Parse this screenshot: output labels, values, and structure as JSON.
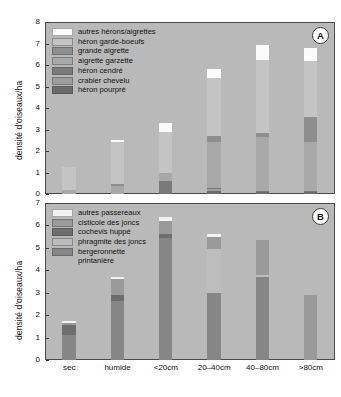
{
  "figure": {
    "panels": [
      {
        "tag": "A",
        "ylabel": "densité d'oiseaux/ha",
        "yticks": [
          "0",
          "1",
          "2",
          "3",
          "4",
          "5",
          "6",
          "7",
          "8"
        ],
        "ylim": [
          0,
          8
        ]
      },
      {
        "tag": "B",
        "ylabel": "densité d'oiseaux/ha",
        "yticks": [
          "0",
          "1",
          "2",
          "3",
          "4",
          "5",
          "6",
          "7"
        ],
        "ylim": [
          0,
          7
        ]
      }
    ],
    "xlabels": [
      "sec",
      "humide",
      "<20cm",
      "20–40cm",
      "40–80cm",
      ">80cm"
    ]
  },
  "colors": {
    "plot_background": "#b9b9b9",
    "axis": "#4a4a4a",
    "text": "#111111",
    "autres_herons": "#fbfbfb",
    "heron_garde_boeufs": "#c4c4c4",
    "grande_aigrette": "#8e8e8e",
    "aigrette_garzette": "#a8a8a8",
    "heron_cendre": "#7a7a7a",
    "crabier_chevelu": "#9d9d9d",
    "heron_pourpre": "#6b6b6b",
    "autres_passereaux": "#f2f2f2",
    "cisticole_des_joncs": "#9a9a9a",
    "cochevis_huppe": "#6e6e6e",
    "phragmite_des_joncs": "#bdbdbd",
    "bergeronnette_printaniere": "#868686"
  },
  "chart_data": [
    {
      "type": "bar",
      "id": "panel-a",
      "title": "",
      "panel_tag": "A",
      "stacked": true,
      "xlabel": "",
      "ylabel": "densité d'oiseaux/ha",
      "ylim": [
        0,
        8
      ],
      "yticks": [
        0,
        1,
        2,
        3,
        4,
        5,
        6,
        7,
        8
      ],
      "grid": false,
      "legend_position": "top-left",
      "categories": [
        "sec",
        "humide",
        "<20cm",
        "20–40cm",
        "40–80cm",
        ">80cm"
      ],
      "series": [
        {
          "name": "héron pourpré",
          "color": "#6b6b6b",
          "values": [
            0.0,
            0.0,
            0.07,
            0.12,
            0.1,
            0.1
          ]
        },
        {
          "name": "crabier chevelu",
          "color": "#9d9d9d",
          "values": [
            0.0,
            0.0,
            0.0,
            0.1,
            0.0,
            0.0
          ]
        },
        {
          "name": "héron cendré",
          "color": "#7a7a7a",
          "values": [
            0.0,
            0.0,
            0.55,
            0.05,
            0.05,
            0.05
          ]
        },
        {
          "name": "aigrette garzette",
          "color": "#a8a8a8",
          "values": [
            0.18,
            0.38,
            0.38,
            2.13,
            2.5,
            2.25
          ]
        },
        {
          "name": "grande aigrette",
          "color": "#8e8e8e",
          "values": [
            0.0,
            0.08,
            0.0,
            0.32,
            0.18,
            1.2
          ]
        },
        {
          "name": "héron garde-boeufs",
          "color": "#c4c4c4",
          "values": [
            1.07,
            1.94,
            1.9,
            2.68,
            3.4,
            2.6
          ]
        },
        {
          "name": "autres hérons/aigrettes",
          "color": "#fbfbfb",
          "values": [
            0.0,
            0.1,
            0.4,
            0.4,
            0.7,
            0.6
          ]
        }
      ],
      "totals": [
        1.25,
        2.5,
        3.1,
        5.8,
        7.8,
        7.8
      ]
    },
    {
      "type": "bar",
      "id": "panel-b",
      "title": "",
      "panel_tag": "B",
      "stacked": true,
      "xlabel": "",
      "ylabel": "densité d'oiseaux/ha",
      "ylim": [
        0,
        7
      ],
      "yticks": [
        0,
        1,
        2,
        3,
        4,
        5,
        6,
        7
      ],
      "grid": false,
      "legend_position": "top-left",
      "categories": [
        "sec",
        "humide",
        "<20cm",
        "20–40cm",
        "40–80cm",
        ">80cm"
      ],
      "series": [
        {
          "name": "bergeronnette printanière",
          "color": "#868686",
          "values": [
            1.1,
            2.65,
            5.45,
            3.0,
            3.7,
            0.0
          ]
        },
        {
          "name": "phragmite des joncs",
          "color": "#bdbdbd",
          "values": [
            0.0,
            0.0,
            0.0,
            1.95,
            0.08,
            0.0
          ]
        },
        {
          "name": "cochevis huppé",
          "color": "#6e6e6e",
          "values": [
            0.45,
            0.25,
            0.15,
            0.0,
            0.0,
            0.0
          ]
        },
        {
          "name": "cisticole des joncs",
          "color": "#9a9a9a",
          "values": [
            0.1,
            0.72,
            0.6,
            0.55,
            1.55,
            2.9
          ]
        },
        {
          "name": "autres passereaux",
          "color": "#f2f2f2",
          "values": [
            0.1,
            0.08,
            0.18,
            0.12,
            0.0,
            0.0
          ]
        }
      ],
      "totals": [
        1.75,
        3.7,
        6.38,
        5.62,
        5.33,
        2.9
      ]
    }
  ],
  "legends": {
    "panel_a": [
      {
        "label": "autres hérons/aigrettes",
        "color": "#fbfbfb"
      },
      {
        "label": "héron garde-boeufs",
        "color": "#c4c4c4"
      },
      {
        "label": "grande aigrette",
        "color": "#8e8e8e"
      },
      {
        "label": "aigrette garzette",
        "color": "#a8a8a8"
      },
      {
        "label": "héron cendré",
        "color": "#7a7a7a"
      },
      {
        "label": "crabier chevelu",
        "color": "#9d9d9d"
      },
      {
        "label": "héron pourpré",
        "color": "#6b6b6b"
      }
    ],
    "panel_b": [
      {
        "label": "autres passereaux",
        "color": "#f2f2f2"
      },
      {
        "label": "cisticole des joncs",
        "color": "#9a9a9a"
      },
      {
        "label": "cochevis huppé",
        "color": "#6e6e6e"
      },
      {
        "label": "phragmite des joncs",
        "color": "#bdbdbd"
      },
      {
        "label": "bergeronnette\nprintanière",
        "color": "#868686"
      }
    ]
  }
}
